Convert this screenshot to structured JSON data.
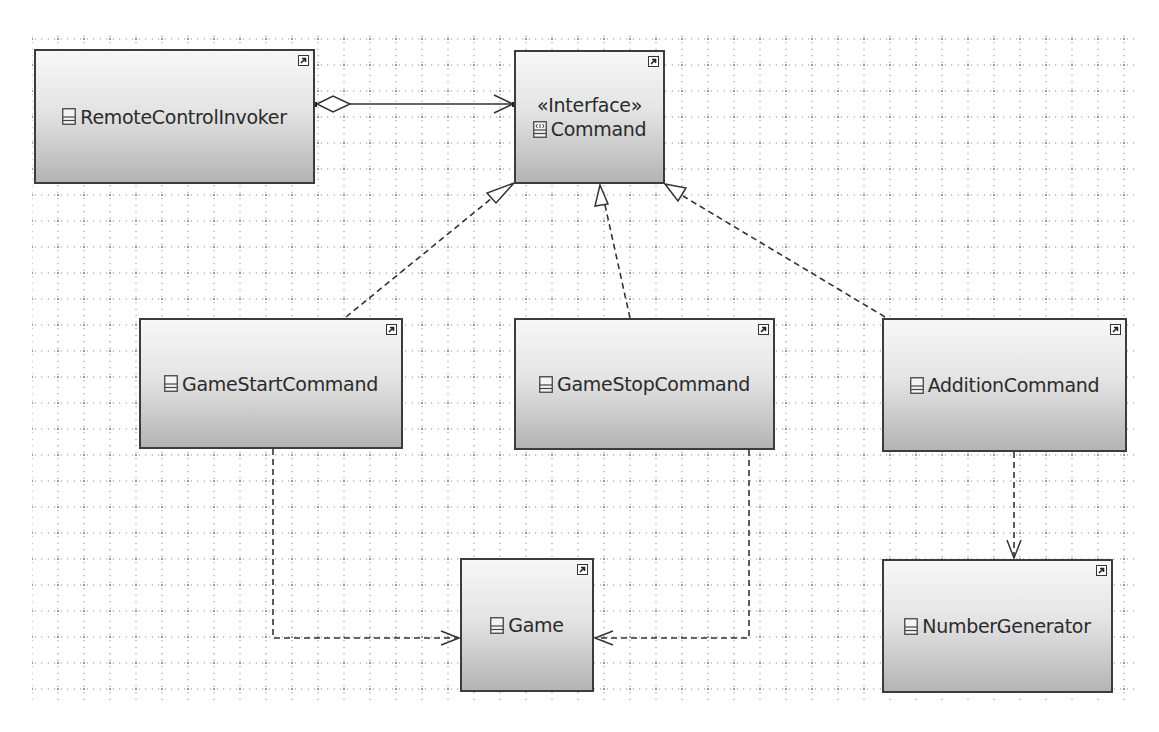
{
  "diagram": {
    "type": "UML class diagram",
    "pattern": "Command",
    "colors": {
      "border": "#3c3c3c",
      "fill_top": "#f7f7f7",
      "fill_bottom": "#b4b4b4",
      "text": "#2b2b2b",
      "grid": "#9a9a9a"
    }
  },
  "nodes": {
    "remote_control_invoker": {
      "name": "RemoteControlInvoker",
      "kind": "class",
      "icon": "class-icon"
    },
    "command": {
      "name": "Command",
      "kind": "interface",
      "stereotype": "«Interface»",
      "icon": "interface-icon"
    },
    "game_start_command": {
      "name": "GameStartCommand",
      "kind": "class",
      "icon": "class-icon"
    },
    "game_stop_command": {
      "name": "GameStopCommand",
      "kind": "class",
      "icon": "class-icon"
    },
    "addition_command": {
      "name": "AdditionCommand",
      "kind": "class",
      "icon": "class-icon"
    },
    "game": {
      "name": "Game",
      "kind": "class",
      "icon": "class-icon"
    },
    "number_generator": {
      "name": "NumberGenerator",
      "kind": "class",
      "icon": "class-icon"
    }
  },
  "edges": [
    {
      "from": "RemoteControlInvoker",
      "to": "Command",
      "type": "aggregation"
    },
    {
      "from": "GameStartCommand",
      "to": "Command",
      "type": "realization"
    },
    {
      "from": "GameStopCommand",
      "to": "Command",
      "type": "realization"
    },
    {
      "from": "AdditionCommand",
      "to": "Command",
      "type": "realization"
    },
    {
      "from": "GameStartCommand",
      "to": "Game",
      "type": "dependency"
    },
    {
      "from": "GameStopCommand",
      "to": "Game",
      "type": "dependency"
    },
    {
      "from": "AdditionCommand",
      "to": "NumberGenerator",
      "type": "dependency"
    }
  ]
}
